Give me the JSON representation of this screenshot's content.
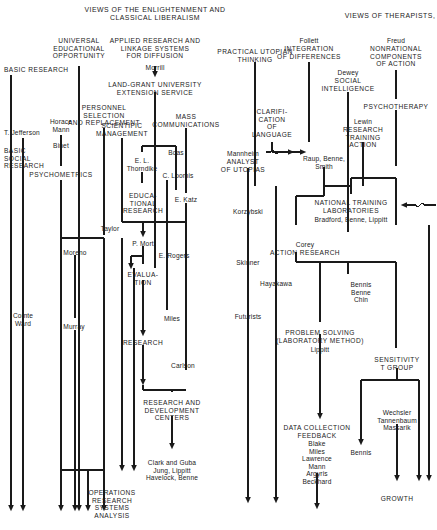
{
  "diagram": {
    "title_left": "VIEWS OF THE ENLIGHTENMENT AND\nCLASSICAL LIBERALISM",
    "title_right": "VIEWS OF THERAPISTS,",
    "type": "flow-chart-genealogy",
    "nodes": [
      {
        "id": "basic-research",
        "text": "BASIC RESEARCH",
        "x": 4,
        "y": 66,
        "align": "l",
        "caps": true
      },
      {
        "id": "universal-ed",
        "text": "UNIVERSAL\nEDUCATIONAL\nOPPORTUNITY",
        "x": 79,
        "y": 37,
        "align": "c",
        "caps": true
      },
      {
        "id": "applied-research",
        "text": "APPLIED RESEARCH AND\nLINKAGE SYSTEMS\nFOR DIFFUSION",
        "x": 155,
        "y": 37,
        "align": "c",
        "caps": true
      },
      {
        "id": "morrill",
        "text": "Morrill",
        "x": 155,
        "y": 64,
        "align": "c",
        "caps": false
      },
      {
        "id": "land-grant",
        "text": "LAND-GRANT UNIVERSITY\nEXTENSION SERVICE",
        "x": 155,
        "y": 81,
        "align": "c",
        "caps": true
      },
      {
        "id": "personnel-selection",
        "text": "PERSONNEL\nSELECTION\nAND REPLACEMENT",
        "x": 104,
        "y": 104,
        "align": "c",
        "caps": true
      },
      {
        "id": "mass-communications",
        "text": "MASS\nCOMMUNICATIONS",
        "x": 186,
        "y": 113,
        "align": "c",
        "caps": true
      },
      {
        "id": "t-jefferson",
        "text": "T. Jefferson",
        "x": 4,
        "y": 129,
        "align": "l",
        "caps": false
      },
      {
        "id": "horace-mann",
        "text": "Horace\nMann",
        "x": 61,
        "y": 118,
        "align": "c",
        "caps": false
      },
      {
        "id": "scientific-management",
        "text": "SCIENTIFIC\nMANAGEMENT",
        "x": 122,
        "y": 122,
        "align": "c",
        "caps": true
      },
      {
        "id": "binet",
        "text": "Binet",
        "x": 61,
        "y": 142,
        "align": "c",
        "caps": false
      },
      {
        "id": "boas",
        "text": "Boas",
        "x": 176,
        "y": 149,
        "align": "c",
        "caps": false
      },
      {
        "id": "basic-social-research",
        "text": "BASIC\nSOCIAL\nRESEARCH",
        "x": 4,
        "y": 147,
        "align": "l",
        "caps": true
      },
      {
        "id": "el-thorndike",
        "text": "E. L.\nThorndike",
        "x": 142,
        "y": 157,
        "align": "c",
        "caps": false
      },
      {
        "id": "psychometrics",
        "text": "PSYCHOMETRICS",
        "x": 61,
        "y": 171,
        "align": "c",
        "caps": true
      },
      {
        "id": "c-loomis",
        "text": "C. Loomis",
        "x": 178,
        "y": 172,
        "align": "c",
        "caps": false
      },
      {
        "id": "educational-research",
        "text": "EDUCA-\nTIONAL\nRESEARCH",
        "x": 143,
        "y": 192,
        "align": "c",
        "caps": true
      },
      {
        "id": "e-katz",
        "text": "E. Katz",
        "x": 186,
        "y": 196,
        "align": "c",
        "caps": false
      },
      {
        "id": "taylor",
        "text": "Taylor",
        "x": 110,
        "y": 225,
        "align": "c",
        "caps": false
      },
      {
        "id": "p-mort",
        "text": "P. Mort",
        "x": 143,
        "y": 240,
        "align": "c",
        "caps": false
      },
      {
        "id": "moreno",
        "text": "Moreno",
        "x": 75,
        "y": 249,
        "align": "c",
        "caps": false
      },
      {
        "id": "e-rogers",
        "text": "E. Rogers",
        "x": 174,
        "y": 252,
        "align": "c",
        "caps": false
      },
      {
        "id": "evaluation",
        "text": "EVALUA-\nTION",
        "x": 143,
        "y": 271,
        "align": "c",
        "caps": true
      },
      {
        "id": "comte-ward",
        "text": "Comte\nWard",
        "x": 23,
        "y": 312,
        "align": "c",
        "caps": false
      },
      {
        "id": "miles-1",
        "text": "Miles",
        "x": 172,
        "y": 315,
        "align": "c",
        "caps": false
      },
      {
        "id": "murray",
        "text": "Murray",
        "x": 74,
        "y": 323,
        "align": "c",
        "caps": false
      },
      {
        "id": "research",
        "text": "RESEARCH",
        "x": 143,
        "y": 339,
        "align": "c",
        "caps": true
      },
      {
        "id": "carlson",
        "text": "Carlson",
        "x": 183,
        "y": 362,
        "align": "c",
        "caps": false
      },
      {
        "id": "rnd-centers",
        "text": "RESEARCH AND\nDEVELOPMENT\nCENTERS",
        "x": 172,
        "y": 399,
        "align": "c",
        "caps": true
      },
      {
        "id": "clark-guba",
        "text": "Clark and Guba\nJung, Lippitt\nHavelock, Benne",
        "x": 172,
        "y": 459,
        "align": "c",
        "caps": false
      },
      {
        "id": "ops-research",
        "text": "OPERATIONS\nRESEARCH\nSYSTEMS\nANALYSIS",
        "x": 112,
        "y": 489,
        "align": "c",
        "caps": true
      },
      {
        "id": "practical-utopian",
        "text": "PRACTICAL UTOPIAN\nTHINKING",
        "x": 255,
        "y": 48,
        "align": "c",
        "caps": true
      },
      {
        "id": "follett",
        "text": "Follett",
        "x": 309,
        "y": 37,
        "align": "c",
        "caps": false
      },
      {
        "id": "integration-diff",
        "text": "INTEGRATION\nOF DIFFERENCES",
        "x": 309,
        "y": 45,
        "align": "c",
        "caps": true
      },
      {
        "id": "freud",
        "text": "Freud",
        "x": 396,
        "y": 37,
        "align": "c",
        "caps": false
      },
      {
        "id": "nonrational",
        "text": "NONRATIONAL\nCOMPONENTS\nOF ACTION",
        "x": 396,
        "y": 45,
        "align": "c",
        "caps": true
      },
      {
        "id": "dewey",
        "text": "Dewey",
        "x": 348,
        "y": 69,
        "align": "c",
        "caps": false
      },
      {
        "id": "social-intelligence",
        "text": "SOCIAL\nINTELLIGENCE",
        "x": 348,
        "y": 77,
        "align": "c",
        "caps": true
      },
      {
        "id": "clarification",
        "text": "CLARIFI-\nCATION\nOF\nLANGUAGE",
        "x": 272,
        "y": 108,
        "align": "c",
        "caps": true
      },
      {
        "id": "psychotherapy",
        "text": "PSYCHOTHERAPY",
        "x": 396,
        "y": 103,
        "align": "c",
        "caps": true
      },
      {
        "id": "lewin",
        "text": "Lewin",
        "x": 363,
        "y": 118,
        "align": "c",
        "caps": false
      },
      {
        "id": "research-training",
        "text": "RESEARCH\nTRAINING\nACTION",
        "x": 363,
        "y": 126,
        "align": "c",
        "caps": true
      },
      {
        "id": "mannheim",
        "text": "Mannheim",
        "x": 243,
        "y": 150,
        "align": "c",
        "caps": false
      },
      {
        "id": "analyst-utopias",
        "text": "ANALYST\nOF UTOPIAS",
        "x": 243,
        "y": 158,
        "align": "c",
        "caps": true
      },
      {
        "id": "raup-benne-smith",
        "text": "Raup, Benne,\nSmith",
        "x": 324,
        "y": 155,
        "align": "c",
        "caps": false
      },
      {
        "id": "korzybski",
        "text": "Korzybski",
        "x": 248,
        "y": 208,
        "align": "c",
        "caps": false
      },
      {
        "id": "ntl",
        "text": "NATIONAL TRAINING\nLABORATORIES",
        "x": 351,
        "y": 199,
        "align": "c",
        "caps": true
      },
      {
        "id": "ntl-people",
        "text": "Bradford, Benne, Lippitt",
        "x": 351,
        "y": 216,
        "align": "c",
        "caps": false
      },
      {
        "id": "corey",
        "text": "Corey",
        "x": 305,
        "y": 241,
        "align": "c",
        "caps": false
      },
      {
        "id": "action-research",
        "text": "ACTION RESEARCH",
        "x": 305,
        "y": 249,
        "align": "c",
        "caps": true
      },
      {
        "id": "skinner",
        "text": "Skinner",
        "x": 248,
        "y": 259,
        "align": "c",
        "caps": false
      },
      {
        "id": "hayakawa",
        "text": "Hayakawa",
        "x": 276,
        "y": 280,
        "align": "c",
        "caps": false
      },
      {
        "id": "bennis-benne-chin",
        "text": "Bennis\nBenne\nChin",
        "x": 361,
        "y": 281,
        "align": "c",
        "caps": false
      },
      {
        "id": "futurists",
        "text": "Futurists",
        "x": 248,
        "y": 313,
        "align": "c",
        "caps": false
      },
      {
        "id": "problem-solving",
        "text": "PROBLEM SOLVING\n(LABORATORY METHOD)",
        "x": 320,
        "y": 329,
        "align": "c",
        "caps": true
      },
      {
        "id": "lippitt",
        "text": "Lippitt",
        "x": 320,
        "y": 346,
        "align": "c",
        "caps": false
      },
      {
        "id": "sensitivity",
        "text": "SENSITIVITY\nT GROUP",
        "x": 397,
        "y": 356,
        "align": "c",
        "caps": true
      },
      {
        "id": "wechsler",
        "text": "Wechsler\nTannenbaum\nMassarik",
        "x": 397,
        "y": 409,
        "align": "c",
        "caps": false
      },
      {
        "id": "data-collection",
        "text": "DATA COLLECTION\nFEEDBACK",
        "x": 317,
        "y": 424,
        "align": "c",
        "caps": true
      },
      {
        "id": "dc-people",
        "text": "Blake\nMiles\nLawrence\nMann\nArgyris\nBeckhard",
        "x": 317,
        "y": 440,
        "align": "c",
        "caps": false
      },
      {
        "id": "bennis",
        "text": "Bennis",
        "x": 361,
        "y": 449,
        "align": "c",
        "caps": false
      },
      {
        "id": "growth",
        "text": "GROWTH",
        "x": 397,
        "y": 495,
        "align": "c",
        "caps": true
      }
    ]
  },
  "colors": {
    "ink": "#1a1a1a",
    "paper": "#ffffff"
  }
}
